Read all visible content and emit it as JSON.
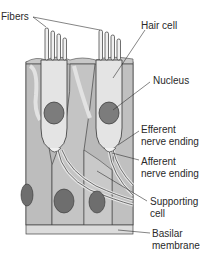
{
  "diagram": {
    "labels": {
      "fibers": "Fibers",
      "hair_cell": "Hair cell",
      "nucleus": "Nucleus",
      "efferent_1": "Efferent",
      "efferent_2": "nerve ending",
      "afferent_1": "Afferent",
      "afferent_2": "nerve ending",
      "supporting_1": "Supporting",
      "supporting_2": "cell",
      "basilar_1": "Basilar",
      "basilar_2": "membrane"
    },
    "colors": {
      "tissue": "#b9b9b9",
      "cell": "#d8d8d8",
      "hair_cell": "#e6e6e6",
      "nucleus": "#7c7c7c",
      "outline": "#3a3a3a",
      "membrane": "#dcdcdc"
    }
  }
}
